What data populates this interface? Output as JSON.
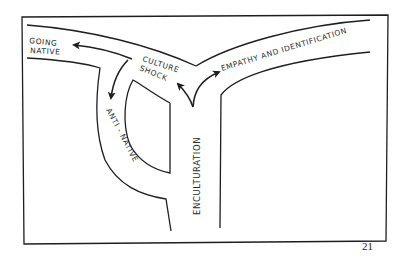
{
  "diagram": {
    "labels": {
      "going_native_line1": "GOING",
      "going_native_line2": "NATIVE",
      "culture_shock_line1": "CULTURE",
      "culture_shock_line2": "SHOCK",
      "empathy": "EMPATHY AND IDENTIFICATION",
      "anti_native": "ANTI - NATIVE",
      "enculturation": "ENCULTURATION"
    },
    "stroke_color": "#1e1e1e",
    "background_color": "#ffffff"
  },
  "page": {
    "number": "21"
  }
}
